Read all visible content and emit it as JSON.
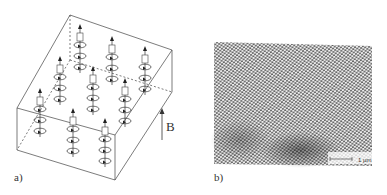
{
  "figure": {
    "panel_a": {
      "label": "a)",
      "field_label": "B",
      "description": "Schematic of vortex lines threading a superconducting slab along the applied field"
    },
    "panel_b": {
      "label": "b)",
      "scale_bar_label": "1 µm",
      "description": "Micrograph of a triangular vortex lattice"
    }
  }
}
